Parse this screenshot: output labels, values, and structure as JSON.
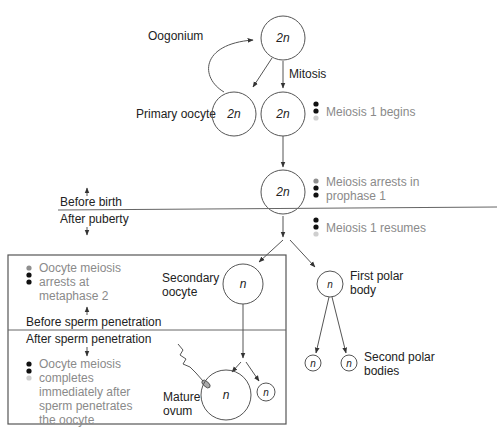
{
  "diagram": {
    "colors": {
      "line": "#555555",
      "text": "#222222",
      "status_text": "#8a8a8a",
      "dot_dark": "#111111",
      "dot_grey_mid": "#8f8f8f",
      "dot_grey_light": "#cfcfcf"
    },
    "cells": {
      "oogonium": {
        "label": "Oogonium",
        "ploidy": "2n"
      },
      "primary_oocyte": {
        "label": "Primary oocyte",
        "ploidy": "2n"
      },
      "mitosis_product": {
        "ploidy": "2n"
      },
      "arrested_cell": {
        "ploidy": "2n"
      },
      "secondary_oocyte": {
        "label_line1": "Secondary",
        "label_line2": "oocyte",
        "ploidy": "n"
      },
      "first_polar_body": {
        "label_line1": "First polar",
        "label_line2": "body",
        "ploidy": "n"
      },
      "second_polar_bodies": {
        "label_line1": "Second polar",
        "label_line2": "bodies",
        "ploidy_a": "n",
        "ploidy_b": "n"
      },
      "mature_ovum": {
        "label_line1": "Mature",
        "label_line2": "ovum",
        "ploidy": "n"
      },
      "ovum_polar_body": {
        "ploidy": "n"
      }
    },
    "process_labels": {
      "mitosis": "Mitosis"
    },
    "status_notes": {
      "meiosis_begins": {
        "text": "Meiosis 1 begins",
        "dots": [
          "dark",
          "dark",
          "light"
        ]
      },
      "meiosis_arrests": {
        "line1": "Meiosis arrests in",
        "line2": "prophase 1",
        "dots": [
          "mid",
          "dark",
          "dark"
        ]
      },
      "meiosis_resumes": {
        "text": "Meiosis 1 resumes",
        "dots": [
          "dark",
          "dark",
          "light"
        ]
      },
      "arrest_metaphase": {
        "line1": "Oocyte meiosis",
        "line2": "arrests at",
        "line3": "metaphase 2",
        "dots": [
          "mid",
          "dark",
          "dark"
        ]
      },
      "completes": {
        "line1": "Oocyte meiosis",
        "line2": "completes",
        "line3": "immediately after",
        "line4": "sperm penetrates",
        "line5": "the oocyte",
        "dots": [
          "dark",
          "dark",
          "light"
        ]
      }
    },
    "timeline": {
      "before_birth": "Before birth",
      "after_puberty": "After puberty",
      "before_sperm": "Before sperm penetration",
      "after_sperm": "After sperm penetration"
    }
  }
}
